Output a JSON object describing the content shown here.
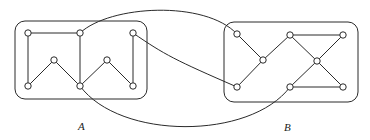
{
  "figure": {
    "labels": {
      "a": "A",
      "b": "B"
    },
    "colors": {
      "stroke": "#2a2a2a",
      "node_fill": "#ffffff",
      "background": "#ffffff"
    },
    "graph_a": {
      "name": "A",
      "nodes": [
        {
          "id": "a1",
          "x": 28,
          "y": 33
        },
        {
          "id": "a2",
          "x": 80,
          "y": 33
        },
        {
          "id": "a3",
          "x": 133,
          "y": 33
        },
        {
          "id": "a4",
          "x": 54,
          "y": 60
        },
        {
          "id": "a5",
          "x": 107,
          "y": 60
        },
        {
          "id": "a6",
          "x": 28,
          "y": 86
        },
        {
          "id": "a7",
          "x": 80,
          "y": 86
        },
        {
          "id": "a8",
          "x": 133,
          "y": 86
        }
      ],
      "edges": [
        [
          "a1",
          "a2"
        ],
        [
          "a1",
          "a6"
        ],
        [
          "a2",
          "a7"
        ],
        [
          "a3",
          "a8"
        ],
        [
          "a6",
          "a4"
        ],
        [
          "a4",
          "a7"
        ],
        [
          "a7",
          "a5"
        ],
        [
          "a5",
          "a8"
        ]
      ]
    },
    "graph_b": {
      "name": "B",
      "nodes": [
        {
          "id": "b1",
          "x": 237,
          "y": 34
        },
        {
          "id": "b2",
          "x": 290,
          "y": 35
        },
        {
          "id": "b3",
          "x": 343,
          "y": 35
        },
        {
          "id": "b4",
          "x": 263,
          "y": 60
        },
        {
          "id": "b5",
          "x": 317,
          "y": 61
        },
        {
          "id": "b6",
          "x": 237,
          "y": 87
        },
        {
          "id": "b7",
          "x": 290,
          "y": 87
        },
        {
          "id": "b8",
          "x": 343,
          "y": 87
        }
      ],
      "edges": [
        [
          "b1",
          "b4"
        ],
        [
          "b4",
          "b2"
        ],
        [
          "b4",
          "b6"
        ],
        [
          "b2",
          "b3"
        ],
        [
          "b2",
          "b5"
        ],
        [
          "b3",
          "b5"
        ],
        [
          "b5",
          "b7"
        ],
        [
          "b5",
          "b8"
        ],
        [
          "b7",
          "b8"
        ]
      ]
    },
    "cross_edges": [
      [
        "a2",
        "b1"
      ],
      [
        "a3",
        "b6"
      ],
      [
        "a7",
        "b7"
      ]
    ]
  }
}
